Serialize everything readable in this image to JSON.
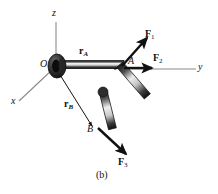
{
  "figure": {
    "caption": "(b)",
    "axes": [
      {
        "name": "z",
        "label": "z"
      },
      {
        "name": "y",
        "label": "y"
      },
      {
        "name": "x",
        "label": "x"
      }
    ],
    "points": [
      {
        "name": "O",
        "label": "O"
      },
      {
        "name": "A",
        "label": "A"
      },
      {
        "name": "B",
        "label": "B"
      }
    ],
    "position_vectors": [
      {
        "name": "r_A",
        "symbol": "r",
        "subscript": "A"
      },
      {
        "name": "r_B",
        "symbol": "r",
        "subscript": "B"
      }
    ],
    "forces": [
      {
        "name": "F1",
        "symbol": "F",
        "subscript": "1"
      },
      {
        "name": "F2",
        "symbol": "F",
        "subscript": "2"
      },
      {
        "name": "F3",
        "symbol": "F",
        "subscript": "3"
      }
    ],
    "colors": {
      "ink": "#111111",
      "axis_line": "#8a8a8a",
      "bar_dark": "#2a2a2a",
      "bar_light": "#d8d8d8",
      "hub": "#3a3a3a",
      "background": "#ffffff"
    }
  }
}
